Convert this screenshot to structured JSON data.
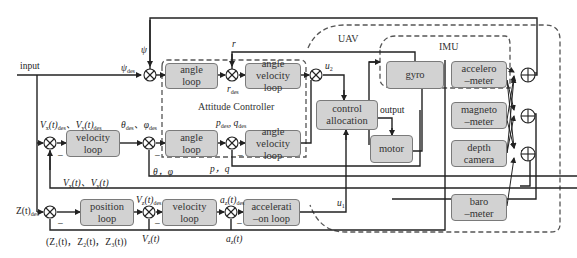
{
  "diagram": {
    "groups": {
      "attitude_controller": "Attitude Controller",
      "uav": "UAV",
      "imu": "IMU"
    },
    "blocks": {
      "angle_loop_yaw": [
        "angle",
        "loop"
      ],
      "angle_velocity_loop_yaw": [
        "angle",
        "velocity loop"
      ],
      "velocity_loop_xy": [
        "velocity",
        "loop"
      ],
      "angle_loop_rp": [
        "angle",
        "loop"
      ],
      "angle_velocity_loop_rp": [
        "angle",
        "velocity loop"
      ],
      "control_allocation": [
        "control",
        "allocation"
      ],
      "motor": [
        "motor"
      ],
      "gyro": [
        "gyro"
      ],
      "accelerometer": [
        "accelero",
        "–meter"
      ],
      "magnetometer": [
        "magneto",
        "–meter"
      ],
      "depth_camera": [
        "depth",
        "camera"
      ],
      "barometer": [
        "baro",
        "–meter"
      ],
      "position_loop": [
        "position",
        "loop"
      ],
      "velocity_loop_z": [
        "velocity",
        "loop"
      ],
      "acceleration_loop": [
        "accelerati",
        "–on loop"
      ]
    },
    "labels": {
      "input": "input",
      "psi": "ψ",
      "psi_des": "ψ",
      "psi_des_sub": "des",
      "r": "r",
      "r_des": "r",
      "r_des_sub": "des",
      "u2": "u",
      "u2_sub": "2",
      "vxy_des": "Vₓ(t)des、Vᵧ(t)des",
      "vx_des_a": "V",
      "vx_des_b": "x",
      "vx_des_c": "(t)",
      "vx_des_d": "des",
      "vy_des_a": "V",
      "vy_des_b": "y",
      "theta_phi_des": "θdes、φdes",
      "theta": "θ",
      "phi": "φ",
      "des": "des",
      "pq_des": "p",
      "q_des": "q",
      "output": "output",
      "pq": "p，q",
      "theta_phi": "θ，φ",
      "vxy_meas": "Vₓ(t)、Vᵧ(t)",
      "z_des": "Z(t)",
      "vz_des": "V",
      "vz_sub": "z",
      "t": "(t)",
      "az_des": "a",
      "az_sub": "z",
      "u1": "u",
      "u1_sub": "1",
      "z_meas": "(Z₁(t)，Z₂(t)，Z₃(t))",
      "vz_meas": "V",
      "az_meas": "a",
      "minus": "–",
      "comma": "、"
    }
  }
}
